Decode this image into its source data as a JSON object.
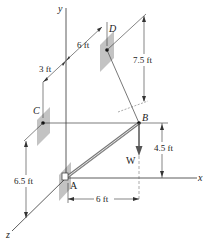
{
  "figure": {
    "type": "3D statics diagram",
    "axes": {
      "x_label": "x",
      "y_label": "y",
      "z_label": "z"
    },
    "points": {
      "A": "A",
      "B": "B",
      "C": "C",
      "D": "D"
    },
    "force": {
      "label": "W",
      "color": "#555555"
    },
    "dimensions": {
      "d_3ft": "3 ft",
      "d_6ft_top": "6 ft",
      "d_7_5ft": "7.5 ft",
      "d_4_5ft": "4.5 ft",
      "d_6_5ft": "6.5 ft",
      "d_6ft_bottom": "6 ft"
    },
    "colors": {
      "line": "#333333",
      "plate": "#b5b5b5",
      "boom": "#888888"
    }
  }
}
